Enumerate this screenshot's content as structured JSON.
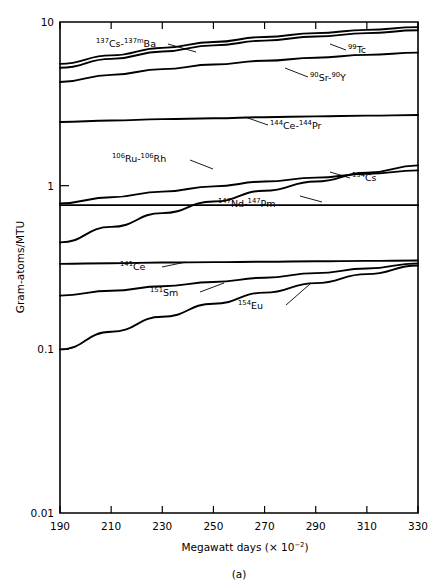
{
  "figure": {
    "caption": "(a)"
  },
  "chart_data": {
    "type": "line",
    "title": "",
    "xlabel": "Megawatt days (× 10−2)",
    "ylabel": "Gram-atoms/MTU",
    "xlabel_parts": {
      "pre": "Megawatt days (× 10",
      "exp": "−2",
      "post": ")"
    },
    "xlim": [
      190,
      330
    ],
    "ylim": [
      0.01,
      10
    ],
    "yscale": "log",
    "xticks": [
      190,
      210,
      230,
      250,
      270,
      290,
      310,
      330
    ],
    "xticklabels": [
      "190",
      "210",
      "230",
      "250",
      "270",
      "290",
      "310",
      "330"
    ],
    "yticks": [
      10,
      1,
      0.1,
      0.01
    ],
    "yticklabels": [
      "10",
      "1",
      "0.1",
      "0.01"
    ],
    "grid": false,
    "legend": "inline-labels",
    "x": [
      190,
      210,
      230,
      250,
      270,
      290,
      310,
      330
    ],
    "series": [
      {
        "name": "137Cs-137mBa",
        "label_parts": [
          {
            "sup": "137",
            "text": "Cs-"
          },
          {
            "sup": "137m",
            "text": "Ba"
          }
        ],
        "label_x": 96,
        "label_y": 47,
        "leader": [
          [
            168,
            44
          ],
          [
            196,
            52
          ]
        ],
        "values": [
          5.55,
          6.25,
          6.95,
          7.55,
          8.1,
          8.55,
          8.95,
          9.3
        ]
      },
      {
        "name": "99Tc",
        "label_parts": [
          {
            "sup": "99",
            "text": "Tc"
          }
        ],
        "label_x": 348,
        "label_y": 53,
        "leader": [
          [
            330,
            44
          ],
          [
            346,
            50
          ]
        ],
        "values": [
          5.25,
          5.95,
          6.6,
          7.2,
          7.7,
          8.15,
          8.55,
          8.9
        ]
      },
      {
        "name": "90Sr-90Y",
        "label_parts": [
          {
            "sup": "90",
            "text": "Sr-"
          },
          {
            "sup": "90",
            "text": "Y"
          }
        ],
        "label_x": 310,
        "label_y": 81,
        "leader": [
          [
            285,
            68
          ],
          [
            308,
            77
          ]
        ],
        "values": [
          4.3,
          4.75,
          5.15,
          5.5,
          5.8,
          6.05,
          6.3,
          6.5
        ]
      },
      {
        "name": "144Ce-144Pr",
        "label_parts": [
          {
            "sup": "144",
            "text": "Ce-"
          },
          {
            "sup": "144",
            "text": "Pr"
          }
        ],
        "label_x": 270,
        "label_y": 129,
        "leader": [
          [
            245,
            117
          ],
          [
            268,
            125
          ]
        ],
        "values": [
          2.45,
          2.5,
          2.55,
          2.58,
          2.62,
          2.65,
          2.68,
          2.7
        ]
      },
      {
        "name": "106Ru-106Rh",
        "label_parts": [
          {
            "sup": "106",
            "text": "Ru-"
          },
          {
            "sup": "106",
            "text": "Rh"
          }
        ],
        "label_x": 112,
        "label_y": 162,
        "leader": [
          [
            190,
            160
          ],
          [
            213,
            169
          ]
        ],
        "values": [
          0.78,
          0.85,
          0.92,
          0.99,
          1.06,
          1.12,
          1.18,
          1.24
        ]
      },
      {
        "name": "134Cs",
        "label_parts": [
          {
            "sup": "134",
            "text": "Cs"
          }
        ],
        "label_x": 352,
        "label_y": 181,
        "leader": [
          [
            330,
            172
          ],
          [
            350,
            178
          ]
        ],
        "values": [
          0.45,
          0.56,
          0.68,
          0.8,
          0.93,
          1.06,
          1.2,
          1.33
        ]
      },
      {
        "name": "147Nd-147Pm",
        "label_parts": [
          {
            "sup": "147",
            "text": "Nd-"
          },
          {
            "sup": "147",
            "text": "Pm"
          }
        ],
        "label_x": 218,
        "label_y": 207,
        "leader": [
          [
            300,
            196
          ],
          [
            322,
            202
          ]
        ],
        "values": [
          0.76,
          0.76,
          0.76,
          0.76,
          0.76,
          0.76,
          0.76,
          0.76
        ]
      },
      {
        "name": "141Ce",
        "label_parts": [
          {
            "sup": "141",
            "text": "Ce"
          }
        ],
        "label_x": 120,
        "label_y": 270,
        "leader": [
          [
            162,
            267
          ],
          [
            186,
            262
          ]
        ],
        "values": [
          0.333,
          0.336,
          0.339,
          0.341,
          0.343,
          0.345,
          0.347,
          0.349
        ]
      },
      {
        "name": "151Sm",
        "label_parts": [
          {
            "sup": "151",
            "text": "Sm"
          }
        ],
        "label_x": 150,
        "label_y": 296,
        "leader": [
          [
            200,
            292
          ],
          [
            224,
            283
          ]
        ],
        "values": [
          0.213,
          0.228,
          0.243,
          0.258,
          0.274,
          0.292,
          0.312,
          0.335
        ]
      },
      {
        "name": "154Eu",
        "label_parts": [
          {
            "sup": "154",
            "text": "Eu"
          }
        ],
        "label_x": 238,
        "label_y": 309,
        "leader": [
          [
            286,
            305
          ],
          [
            310,
            284
          ]
        ],
        "values": [
          0.1,
          0.128,
          0.158,
          0.19,
          0.222,
          0.254,
          0.288,
          0.325
        ]
      }
    ]
  }
}
